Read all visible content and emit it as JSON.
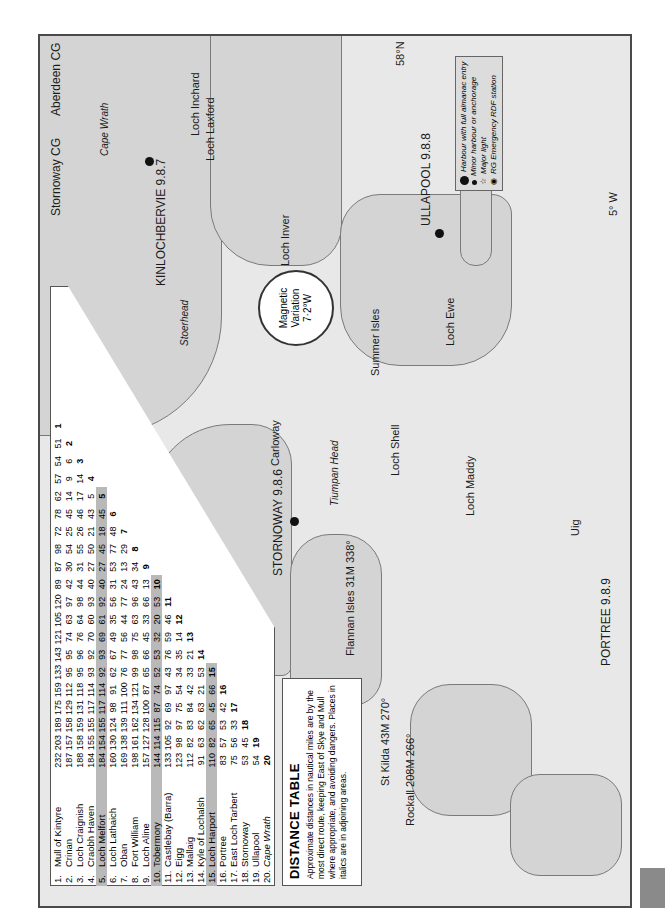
{
  "map": {
    "orientation": "rotated 90° counter-clockwise",
    "latitude_labels": [
      "58°N",
      "30'"
    ],
    "longitude_labels": [
      "30'",
      "5° W",
      "30'",
      "6°",
      "7°",
      "30'",
      "8°"
    ],
    "magnetic_variation": {
      "line1": "Magnetic",
      "line2": "Variation",
      "line3": "7·2°W"
    },
    "coastguard_boundary": {
      "left": "Stornoway CG",
      "right": "Aberdeen CG"
    },
    "harbours_full": [
      "KINLOCHBERVIE 9.8.7",
      "ULLAPOOL 9.8.8",
      "STORNOWAY 9.8.6",
      "PORTREE 9.8.9"
    ],
    "minor_harbours": [
      "Loch Inchard",
      "Loch Laxford",
      "Loch Nedd",
      "Loch Inver",
      "Summer Isles",
      "Loch Ewe",
      "Loch Gairloch",
      "Loch Torridon",
      "Loch a'Bhraige",
      "Acairseid Mhòr",
      "Uig",
      "Loch Dunvegan",
      "Loch Shell",
      "East Loch Tarbert",
      "West Loch Tarbert",
      "Carloway",
      "Little Bernera",
      "Leverburgh",
      "Rodel",
      "Loch Maddy",
      "Loch Eport",
      "Kallin",
      "Ballivanich",
      "Loch Carnan",
      "Scolpaig"
    ],
    "major_lights": [
      "Cape Wrath",
      "Stoerhead",
      "Rubha Reidh",
      "Butt of Lewis",
      "Tiumpan Head",
      "Eilean Glas",
      "Neist Point",
      "Rona"
    ],
    "rdf_stations": [
      "Sandwick",
      "Rodel"
    ],
    "italic_places": [
      "Loch Eriboll",
      "Badcall Bay",
      "Cape Wrath",
      "Stoerhead",
      "Rubha Reidh",
      "Butt of Lewis",
      "Tiumpan Head",
      "Sound of Raasay",
      "Rona",
      "Raasay",
      "Shiant Isles",
      "Eilean Glas",
      "Lewis",
      "Loch Seaforth",
      "Harris",
      "North Uist",
      "Benbecula",
      "Neist Point"
    ],
    "other_labels": [
      "Sound of Harris",
      "Monach Islands (Shillay)"
    ],
    "bearings": [
      {
        "label": "Flannan Isles 31M 338°"
      },
      {
        "label": "St Kilda 43M 270°"
      },
      {
        "label": "Rockall 208M 266°"
      }
    ]
  },
  "legend": {
    "items": [
      {
        "symbol": "large-dot",
        "label": "Harbour with full almanac entry"
      },
      {
        "symbol": "small-dot",
        "label": "Minor harbour or anchorage"
      },
      {
        "symbol": "star",
        "label": "Major light"
      },
      {
        "symbol": "rdf",
        "label": "RG Emergency RDF station"
      }
    ]
  },
  "distance_table": {
    "title": "DISTANCE TABLE",
    "description": "Approximate distances in nautical miles are by the most direct route, keeping East of Skye and Mull where appropriate, and avoiding dangers. Places in italics are in adjoining areas.",
    "places": [
      {
        "n": "1.",
        "name": "Mull of Kintyre",
        "dist": [
          232,
          203,
          189,
          175,
          159,
          133,
          143,
          121,
          105,
          120,
          89,
          87,
          98,
          72,
          78,
          62,
          57,
          54,
          51
        ],
        "shade": false
      },
      {
        "n": "2.",
        "name": "Crinan",
        "dist": [
          187,
          157,
          158,
          129,
          112,
          95,
          95,
          74,
          63,
          97,
          42,
          30,
          54,
          25,
          45,
          14,
          9,
          6
        ],
        "shade": false
      },
      {
        "n": "3.",
        "name": "Loch Craignish",
        "dist": [
          188,
          158,
          159,
          131,
          118,
          95,
          96,
          76,
          64,
          98,
          44,
          31,
          55,
          26,
          46,
          17,
          14
        ],
        "shade": false
      },
      {
        "n": "4.",
        "name": "Craobh Haven",
        "dist": [
          184,
          155,
          155,
          117,
          114,
          93,
          92,
          70,
          60,
          93,
          40,
          27,
          50,
          21,
          43,
          5
        ],
        "shade": false
      },
      {
        "n": "5.",
        "name": "Loch Melfort",
        "dist": [
          184,
          154,
          155,
          117,
          114,
          92,
          93,
          69,
          61,
          92,
          40,
          27,
          45,
          18,
          45
        ],
        "shade": true
      },
      {
        "n": "6.",
        "name": "Loch Lathaich",
        "dist": [
          160,
          130,
          124,
          98,
          91,
          62,
          67,
          49,
          35,
          56,
          31,
          53,
          77,
          48
        ],
        "shade": false
      },
      {
        "n": "7.",
        "name": "Oban",
        "dist": [
          169,
          138,
          139,
          111,
          100,
          76,
          77,
          56,
          44,
          77,
          24,
          13,
          29
        ],
        "shade": false
      },
      {
        "n": "8.",
        "name": "Fort William",
        "dist": [
          198,
          161,
          162,
          134,
          121,
          99,
          98,
          75,
          63,
          96,
          43,
          34
        ],
        "shade": false
      },
      {
        "n": "9.",
        "name": "Loch Aline",
        "dist": [
          157,
          127,
          128,
          100,
          87,
          65,
          66,
          45,
          33,
          66,
          13
        ],
        "shade": false
      },
      {
        "n": "10.",
        "name": "Tobermory",
        "dist": [
          144,
          114,
          115,
          87,
          74,
          52,
          53,
          32,
          20,
          53
        ],
        "shade": true
      },
      {
        "n": "11.",
        "name": "Castlebay (Barra)",
        "dist": [
          133,
          105,
          92,
          69,
          97,
          43,
          76,
          59,
          46
        ],
        "shade": false
      },
      {
        "n": "12.",
        "name": "Eigg",
        "dist": [
          123,
          98,
          97,
          75,
          54,
          34,
          35,
          14
        ],
        "shade": false
      },
      {
        "n": "13.",
        "name": "Mallaig",
        "dist": [
          112,
          82,
          83,
          84,
          42,
          33,
          21
        ],
        "shade": false
      },
      {
        "n": "14.",
        "name": "Kyle of Lochalsh",
        "dist": [
          91,
          63,
          62,
          63,
          21,
          53
        ],
        "shade": false
      },
      {
        "n": "15.",
        "name": "Loch Harport",
        "dist": [
          110,
          82,
          65,
          45,
          66
        ],
        "shade": true
      },
      {
        "n": "16.",
        "name": "Portree",
        "dist": [
          83,
          57,
          53,
          42
        ],
        "shade": false
      },
      {
        "n": "17.",
        "name": "East Loch Tarbert",
        "dist": [
          75,
          56,
          33
        ],
        "shade": false
      },
      {
        "n": "18.",
        "name": "Stornoway",
        "dist": [
          53,
          45
        ],
        "shade": false
      },
      {
        "n": "19.",
        "name": "Ullapool",
        "dist": [
          54
        ],
        "shade": false
      },
      {
        "n": "20.",
        "name": "Cape Wrath",
        "dist": [],
        "shade": false,
        "italic": true
      }
    ],
    "column_order_note": "values listed toward destinations 20,19,...; diagonal shows own index number"
  },
  "chart_data": {
    "type": "table",
    "title": "DISTANCE TABLE",
    "units": "nautical miles"
  }
}
